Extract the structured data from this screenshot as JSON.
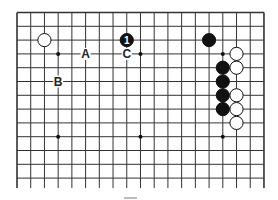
{
  "board": {
    "cols": 19,
    "rows": 13,
    "origin_x": 17,
    "origin_y": 12.5,
    "spacing_x": 13.72,
    "spacing_y": 13.8,
    "bottom_open_extend": 10,
    "line_color": "#333333",
    "star_points": [
      [
        3,
        3
      ],
      [
        9,
        3
      ],
      [
        15,
        3
      ],
      [
        3,
        9
      ],
      [
        9,
        9
      ],
      [
        15,
        9
      ]
    ]
  },
  "stones": [
    {
      "color": "white",
      "col": 2,
      "row": 2
    },
    {
      "color": "black",
      "col": 8,
      "row": 2,
      "label": "1"
    },
    {
      "color": "black",
      "col": 14,
      "row": 2
    },
    {
      "color": "white",
      "col": 16,
      "row": 3
    },
    {
      "color": "black",
      "col": 15,
      "row": 4
    },
    {
      "color": "white",
      "col": 16,
      "row": 4
    },
    {
      "color": "black",
      "col": 15,
      "row": 5
    },
    {
      "color": "black",
      "col": 15,
      "row": 6
    },
    {
      "color": "white",
      "col": 16,
      "row": 6
    },
    {
      "color": "black",
      "col": 15,
      "row": 7
    },
    {
      "color": "white",
      "col": 16,
      "row": 7
    },
    {
      "color": "white",
      "col": 16,
      "row": 8
    }
  ],
  "markers": [
    {
      "text": "A",
      "col": 5,
      "row": 3
    },
    {
      "text": "C",
      "col": 8,
      "row": 3
    },
    {
      "text": "B",
      "col": 3,
      "row": 5
    }
  ]
}
